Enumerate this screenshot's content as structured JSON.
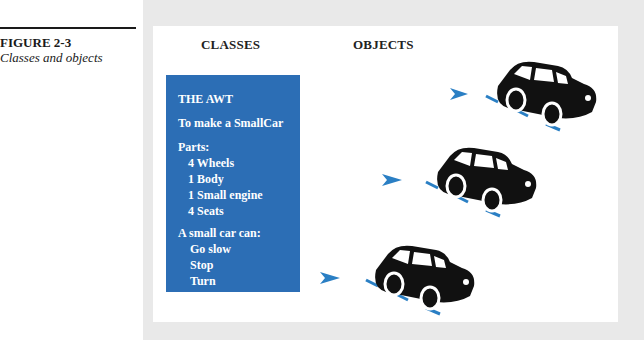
{
  "figure": {
    "number": "FIGURE 2-3",
    "caption": "Classes and objects"
  },
  "headers": {
    "classes": "CLASSES",
    "objects": "OBJECTS"
  },
  "class_box": {
    "title": "THE AWT",
    "subtitle": "To make a SmallCar",
    "parts_label": "Parts:",
    "parts": [
      "4  Wheels",
      "1  Body",
      "1  Small engine",
      "4  Seats"
    ],
    "abilities_label": "A small car can:",
    "abilities": [
      "Go slow",
      "Stop",
      "Turn"
    ]
  },
  "objects": [
    {
      "name": "car-object-1",
      "icon": "car-icon"
    },
    {
      "name": "car-object-2",
      "icon": "car-icon"
    },
    {
      "name": "car-object-3",
      "icon": "car-icon"
    }
  ],
  "colors": {
    "accent_blue": "#2c6eb5",
    "arrow_blue": "#2a7fc4",
    "car": "#111111",
    "background": "#e9e9e9"
  }
}
